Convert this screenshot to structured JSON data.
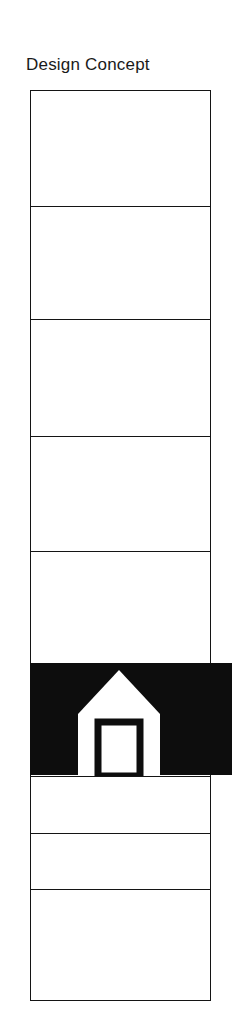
{
  "page": {
    "title": "Design Concept",
    "background_color": "#ffffff",
    "ink_color": "#141414",
    "band_color": "#0d0d0d",
    "width": 240,
    "height": 1018
  },
  "diagram": {
    "name": "design-concept-panel-stack",
    "column": {
      "x": 30,
      "y": 90,
      "width": 181,
      "height": 911,
      "border_color": "#141414",
      "fill_color": "#ffffff"
    },
    "divider_positions": [
      205,
      318,
      435,
      550,
      663,
      775,
      832,
      888
    ],
    "cells": [
      {
        "index": 1,
        "label": "",
        "top": 90,
        "height": 115,
        "fill": "#ffffff"
      },
      {
        "index": 2,
        "label": "",
        "top": 205,
        "height": 113,
        "fill": "#ffffff"
      },
      {
        "index": 3,
        "label": "",
        "top": 318,
        "height": 117,
        "fill": "#ffffff"
      },
      {
        "index": 4,
        "label": "",
        "top": 435,
        "height": 115,
        "fill": "#ffffff"
      },
      {
        "index": 5,
        "label": "",
        "top": 550,
        "height": 113,
        "fill": "#ffffff"
      },
      {
        "index": 6,
        "label": "",
        "top": 663,
        "height": 112,
        "fill": "#0d0d0d"
      },
      {
        "index": 7,
        "label": "",
        "top": 775,
        "height": 57,
        "fill": "#ffffff"
      },
      {
        "index": 8,
        "label": "",
        "top": 832,
        "height": 56,
        "fill": "#ffffff"
      },
      {
        "index": 9,
        "label": "",
        "top": 888,
        "height": 113,
        "fill": "#ffffff"
      }
    ],
    "highlight_band": {
      "x": 30,
      "y": 663,
      "width": 202,
      "height": 112,
      "color": "#0d0d0d",
      "overhang_right": 21
    },
    "house_symbol": {
      "icon_name": "house-icon",
      "body_color": "#ffffff",
      "window_color": "#0d0d0d",
      "window_fill": "#ffffff",
      "x": 78,
      "y": 670,
      "width": 82,
      "height": 106
    }
  }
}
